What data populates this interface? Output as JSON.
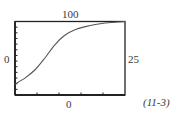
{
  "figure": {
    "top_label": "100",
    "left_label": "0",
    "right_label": "25",
    "bottom_label": "0",
    "equation_number": "(11-3)",
    "line_color": "#555555",
    "axis_color": "#222222"
  },
  "chart_data": {
    "type": "line",
    "title": "",
    "xlabel": "",
    "ylabel": "",
    "annotations": [
      "100",
      "0",
      "25",
      "0",
      "(11-3)"
    ],
    "x": [
      0,
      0.09,
      0.18,
      0.27,
      0.36,
      0.45,
      0.55,
      0.64,
      0.73,
      0.82,
      0.91,
      1.0
    ],
    "series": [
      {
        "name": "sigmoid",
        "values": [
          0.15,
          0.23,
          0.34,
          0.5,
          0.68,
          0.81,
          0.89,
          0.93,
          0.96,
          0.98,
          0.99,
          1.0
        ]
      }
    ],
    "xlim": [
      0,
      1
    ],
    "ylim": [
      0,
      1
    ],
    "grid": false,
    "legend": "none",
    "x_ticks_count": 4,
    "y_ticks_count": 12
  }
}
